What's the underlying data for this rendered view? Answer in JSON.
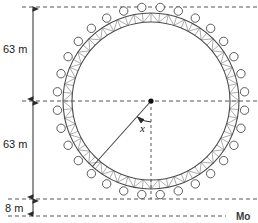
{
  "figure": {
    "title_alt": "Ferris wheel cross-section diagram",
    "background_color": "#ffffff",
    "stroke_color": "#4a4a4a",
    "truss_color": "#8a8a8a",
    "dim_color": "#2b2b2b",
    "dash_color": "#555555"
  },
  "labels": {
    "top_half_height": "63 m",
    "bottom_half_height": "63 m",
    "ground_clearance": "8 m",
    "angle": "x",
    "corner_text": "Mo"
  },
  "geometry": {
    "center_x": 151,
    "center_y": 101,
    "inner_radius": 79,
    "outer_radius": 88,
    "capsule_orbit_radius": 94,
    "capsule_radius": 4.2,
    "capsule_count": 32,
    "truss_segments": 64,
    "ground_y": 216,
    "top_tangent_y": 7,
    "bottom_tangent_y": 199,
    "dim_line_x": 33,
    "radius_angle_deg": 228
  },
  "chart_data": {
    "type": "diagram",
    "annotations": [
      {
        "name": "top-half-height",
        "text": "63 m",
        "value": 63,
        "unit": "m"
      },
      {
        "name": "bottom-half-height",
        "text": "63 m",
        "value": 63,
        "unit": "m"
      },
      {
        "name": "ground-clearance",
        "text": "8 m",
        "value": 8,
        "unit": "m"
      },
      {
        "name": "angle",
        "text": "x"
      }
    ],
    "derived": {
      "radius_m": 63,
      "diameter_m": 126,
      "max_height_m": 134,
      "min_height_m": 8,
      "axle_height_m": 71
    }
  }
}
